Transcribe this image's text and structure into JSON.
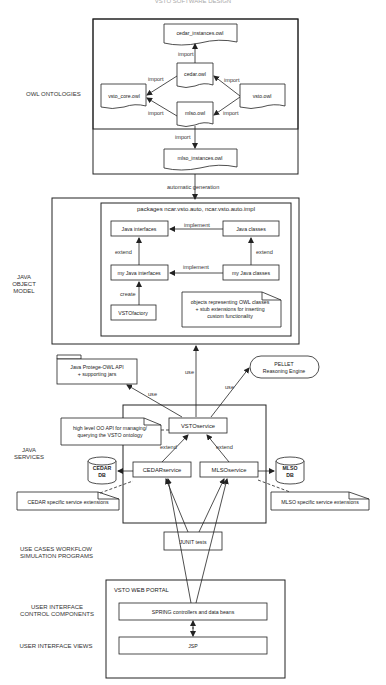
{
  "title": "VSTO SOFTWARE DESIGN",
  "layers": {
    "owl": "OWL ONTOLOGIES",
    "java_object_model": [
      "JAVA",
      "OBJECT",
      "MODEL"
    ],
    "java_services": [
      "JAVA",
      "SERVICES"
    ],
    "use_cases": [
      "USE CASES WORKFLOW",
      "SIMULATION PROGRAMS"
    ],
    "ui_control": [
      "USER INTERFACE",
      "CONTROL COMPONENTS"
    ],
    "ui_views": "USER INTERFACE VIEWS"
  },
  "owl_ontologies": {
    "cedar_instances": "cedar_instances.owl",
    "cedar": "cedar.owl",
    "vsto_core": "vsto_core.owl",
    "vsto": "vsto.owl",
    "mlso": "mlso.owl",
    "mlso_instances": "mlso_instances.owl",
    "edge_label": "import"
  },
  "automatic_generation": "automatic generation",
  "java_object_model": {
    "package_title": "packages ncar.vsto.auto, ncar.vsto.auto.impl",
    "java_interfaces": "Java interfaces",
    "java_classes": "Java classes",
    "my_java_interfaces": "my Java interfaces",
    "my_java_classes": "my Java classes",
    "vsto_factory": "VSTOfactory",
    "note": [
      "objects representing OWL classes",
      "+ stub extensions for inserting",
      "custom functionality"
    ],
    "implement": "implement",
    "extend": "extend",
    "create": "create"
  },
  "external": {
    "protege": [
      "Java Protege-OWL API",
      "+ supporting jars"
    ],
    "pellet": [
      "PELLET",
      "Reasoning Engine"
    ],
    "use": "use"
  },
  "java_services": {
    "vsto_service": "VSTOservice",
    "cedar_service": "CEDARservice",
    "mlso_service": "MLSOservice",
    "api_note": [
      "high level OO API for managing/",
      "querying the VSTO ontology"
    ],
    "cedar_db": [
      "CEDAR",
      "DB"
    ],
    "mlso_db": [
      "MLSO",
      "DB"
    ],
    "cedar_ext": "CEDAR specific service extensions",
    "mlso_ext": "MLSO specific service extensions",
    "extend": "extend"
  },
  "junit": "JUNIT tests",
  "web_portal": {
    "title": "VSTO WEB PORTAL",
    "spring": "SPRING controllers and data beans",
    "jsp": "JSP"
  }
}
